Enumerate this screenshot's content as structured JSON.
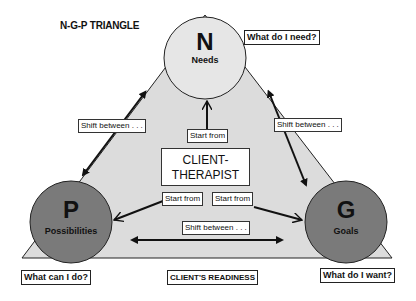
{
  "title": "N-G-P TRIANGLE",
  "nodes": {
    "needs": {
      "letter": "N",
      "label": "Needs",
      "question": "What do I need?"
    },
    "possibilities": {
      "letter": "P",
      "label": "Possibilities",
      "question": "What can I do?"
    },
    "goals": {
      "letter": "G",
      "label": "Goals",
      "question": "What do I want?"
    }
  },
  "center": {
    "line1": "CLIENT-",
    "line2": "THERAPIST"
  },
  "edge_labels": {
    "shift_left": "Shift between . . .",
    "shift_right": "Shift between . . .",
    "shift_bottom": "Shift between . . .",
    "start_top": "Start from",
    "start_left": "Start from",
    "start_right": "Start from"
  },
  "base_label": "CLIENT'S READINESS",
  "colors": {
    "triangle_fill": "#dcdcdc",
    "needs_fill": "#e6e6e6",
    "dark_circle_fill": "#7a7a7a",
    "stroke": "#222222"
  }
}
